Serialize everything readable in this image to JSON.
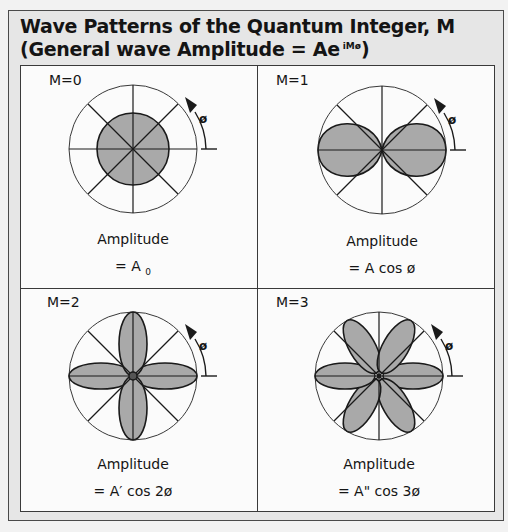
{
  "title": {
    "line1": "Wave Patterns of the Quantum Integer, M",
    "line2_prefix": "(General wave Amplitude = Ae",
    "line2_superscript": "iMø",
    "line2_suffix": ")"
  },
  "panels": [
    {
      "m_label": "M=0",
      "amplitude_label": "Amplitude",
      "formula": "= A",
      "formula_sub": "0",
      "angle_label": "ø",
      "lobes": 0
    },
    {
      "m_label": "M=1",
      "amplitude_label": "Amplitude",
      "formula": "= A cos ø",
      "formula_sub": "",
      "angle_label": "ø",
      "lobes": 2
    },
    {
      "m_label": "M=2",
      "amplitude_label": "Amplitude",
      "formula": "= A′ cos 2ø",
      "formula_sub": "",
      "angle_label": "ø",
      "lobes": 4
    },
    {
      "m_label": "M=3",
      "amplitude_label": "Amplitude",
      "formula": "= A\" cos 3ø",
      "formula_sub": "",
      "angle_label": "ø",
      "lobes": 6
    }
  ],
  "colors": {
    "lobe_fill": "#a9a9a9",
    "line": "#1a1a1a",
    "panel_bg": "#fbfbfb",
    "frame_bg": "#e6e6e6"
  }
}
